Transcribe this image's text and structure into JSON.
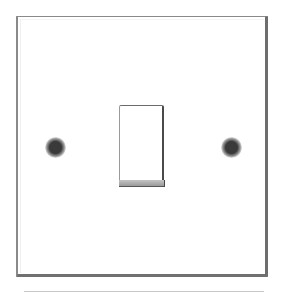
{
  "image": {
    "subject": "single-gang wall light switch plate",
    "colors": {
      "plate": "#ffffff",
      "plate_edge": "#707070",
      "screw_center": "#3a3a3a",
      "rocker_bottom": "#a8a8a8"
    }
  }
}
